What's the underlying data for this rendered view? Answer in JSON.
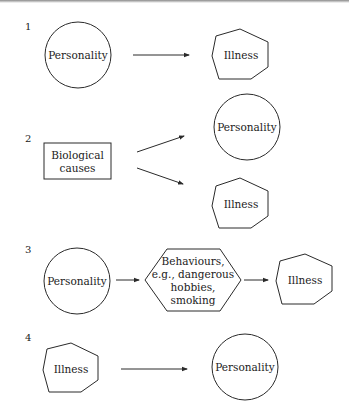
{
  "diagram": {
    "panels": [
      {
        "number": "1",
        "nodes": [
          {
            "id": "p1-personality",
            "label": "Personality",
            "shape": "circle"
          },
          {
            "id": "p1-illness",
            "label": "Illness",
            "shape": "heptagon"
          }
        ],
        "edges": [
          {
            "from": "p1-personality",
            "to": "p1-illness"
          }
        ]
      },
      {
        "number": "2",
        "nodes": [
          {
            "id": "p2-bio",
            "label_lines": [
              "Biological",
              "causes"
            ],
            "shape": "rectangle"
          },
          {
            "id": "p2-personality",
            "label": "Personality",
            "shape": "circle"
          },
          {
            "id": "p2-illness",
            "label": "Illness",
            "shape": "heptagon"
          }
        ],
        "edges": [
          {
            "from": "p2-bio",
            "to": "p2-personality"
          },
          {
            "from": "p2-bio",
            "to": "p2-illness"
          }
        ]
      },
      {
        "number": "3",
        "nodes": [
          {
            "id": "p3-personality",
            "label": "Personality",
            "shape": "circle"
          },
          {
            "id": "p3-behaviours",
            "label_lines": [
              "Behaviours,",
              "e.g., dangerous",
              "hobbies,",
              "smoking"
            ],
            "shape": "hexagon"
          },
          {
            "id": "p3-illness",
            "label": "Illness",
            "shape": "heptagon"
          }
        ],
        "edges": [
          {
            "from": "p3-personality",
            "to": "p3-behaviours"
          },
          {
            "from": "p3-behaviours",
            "to": "p3-illness"
          }
        ]
      },
      {
        "number": "4",
        "nodes": [
          {
            "id": "p4-illness",
            "label": "Illness",
            "shape": "heptagon"
          },
          {
            "id": "p4-personality",
            "label": "Personality",
            "shape": "circle"
          }
        ],
        "edges": [
          {
            "from": "p4-illness",
            "to": "p4-personality"
          }
        ]
      }
    ],
    "colors": {
      "stroke": "#2a2a2a",
      "text": "#222222",
      "background": "#ffffff"
    }
  }
}
